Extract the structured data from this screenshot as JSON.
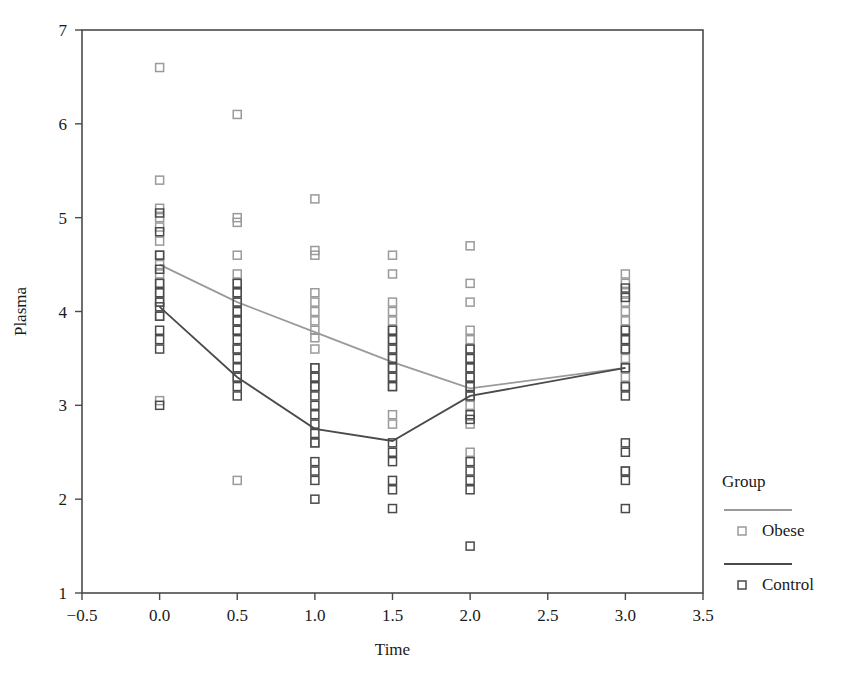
{
  "chart_data": {
    "type": "scatter",
    "title": "",
    "xlabel": "Time",
    "ylabel": "Plasma",
    "xlim": [
      -0.5,
      3.5
    ],
    "ylim": [
      1,
      7
    ],
    "xticks": [
      -0.5,
      0.0,
      0.5,
      1.0,
      1.5,
      2.0,
      2.5,
      3.0,
      3.5
    ],
    "xtick_labels": [
      "−0.5",
      "0.0",
      "0.5",
      "1.0",
      "1.5",
      "2.0",
      "2.5",
      "3.0",
      "3.5"
    ],
    "yticks": [
      1,
      2,
      3,
      4,
      5,
      6,
      7
    ],
    "ytick_labels": [
      "1",
      "2",
      "3",
      "4",
      "5",
      "6",
      "7"
    ],
    "grid": false,
    "legend": {
      "title": "Group",
      "position": "right",
      "entries": [
        {
          "name": "Obese",
          "color": "#9a9a9a",
          "marker": "open-square"
        },
        {
          "name": "Control",
          "color": "#4a4a4a",
          "marker": "open-square"
        }
      ]
    },
    "series": [
      {
        "name": "Obese",
        "color": "#9a9a9a",
        "marker": "open-square",
        "mean_line": {
          "x": [
            0.0,
            0.5,
            1.0,
            1.5,
            2.0,
            3.0
          ],
          "y": [
            4.5,
            4.1,
            3.78,
            3.46,
            3.18,
            3.4
          ]
        },
        "points": {
          "x": [
            0.0,
            0.0,
            0.0,
            0.0,
            0.0,
            0.0,
            0.0,
            0.0,
            0.0,
            0.0,
            0.0,
            0.0,
            0.0,
            0.0,
            0.5,
            0.5,
            0.5,
            0.5,
            0.5,
            0.5,
            0.5,
            0.5,
            0.5,
            0.5,
            0.5,
            0.5,
            0.5,
            0.5,
            1.0,
            1.0,
            1.0,
            1.0,
            1.0,
            1.0,
            1.0,
            1.0,
            1.0,
            1.0,
            1.0,
            1.0,
            1.0,
            1.0,
            1.5,
            1.5,
            1.5,
            1.5,
            1.5,
            1.5,
            1.5,
            1.5,
            1.5,
            1.5,
            1.5,
            1.5,
            1.5,
            1.5,
            2.0,
            2.0,
            2.0,
            2.0,
            2.0,
            2.0,
            2.0,
            2.0,
            2.0,
            2.0,
            2.0,
            2.0,
            2.0,
            2.0,
            3.0,
            3.0,
            3.0,
            3.0,
            3.0,
            3.0,
            3.0,
            3.0,
            3.0,
            3.0,
            3.0,
            3.0,
            3.0,
            3.0
          ],
          "y": [
            6.6,
            5.4,
            5.1,
            5.0,
            4.9,
            4.75,
            4.6,
            4.5,
            4.4,
            4.3,
            4.2,
            4.1,
            3.95,
            3.05,
            6.1,
            5.0,
            4.95,
            4.6,
            4.4,
            4.3,
            4.2,
            4.1,
            4.0,
            3.9,
            3.8,
            3.6,
            3.3,
            2.2,
            5.2,
            4.65,
            4.6,
            4.2,
            4.1,
            4.0,
            3.9,
            3.8,
            3.72,
            3.6,
            3.4,
            3.3,
            3.2,
            2.6,
            4.6,
            4.4,
            4.1,
            4.0,
            3.9,
            3.8,
            3.7,
            3.6,
            3.5,
            3.4,
            3.3,
            3.2,
            2.9,
            2.8,
            4.7,
            4.3,
            4.1,
            3.8,
            3.7,
            3.6,
            3.5,
            3.4,
            3.3,
            3.2,
            3.1,
            3.0,
            2.8,
            2.5,
            4.4,
            4.3,
            4.2,
            4.1,
            4.0,
            3.9,
            3.8,
            3.7,
            3.6,
            3.5,
            3.4,
            3.3,
            3.2,
            2.3
          ]
        }
      },
      {
        "name": "Control",
        "color": "#4a4a4a",
        "marker": "open-square",
        "mean_line": {
          "x": [
            0.0,
            0.5,
            1.0,
            1.5,
            2.0,
            3.0
          ],
          "y": [
            4.05,
            3.3,
            2.75,
            2.62,
            3.1,
            3.4
          ]
        },
        "points": {
          "x": [
            0.0,
            0.0,
            0.0,
            0.0,
            0.0,
            0.0,
            0.0,
            0.0,
            0.0,
            0.0,
            0.0,
            0.0,
            0.0,
            0.5,
            0.5,
            0.5,
            0.5,
            0.5,
            0.5,
            0.5,
            0.5,
            0.5,
            0.5,
            0.5,
            0.5,
            0.5,
            1.0,
            1.0,
            1.0,
            1.0,
            1.0,
            1.0,
            1.0,
            1.0,
            1.0,
            1.0,
            1.0,
            1.0,
            1.0,
            1.5,
            1.5,
            1.5,
            1.5,
            1.5,
            1.5,
            1.5,
            1.5,
            1.5,
            1.5,
            1.5,
            1.5,
            1.5,
            2.0,
            2.0,
            2.0,
            2.0,
            2.0,
            2.0,
            2.0,
            2.0,
            2.0,
            2.0,
            2.0,
            2.0,
            2.0,
            3.0,
            3.0,
            3.0,
            3.0,
            3.0,
            3.0,
            3.0,
            3.0,
            3.0,
            3.0,
            3.0,
            3.0,
            3.0
          ],
          "y": [
            5.05,
            4.85,
            4.6,
            4.45,
            4.3,
            4.2,
            4.1,
            4.05,
            3.95,
            3.8,
            3.7,
            3.6,
            3.0,
            4.3,
            4.2,
            4.1,
            4.0,
            3.9,
            3.8,
            3.7,
            3.6,
            3.5,
            3.4,
            3.3,
            3.2,
            3.1,
            3.4,
            3.3,
            3.2,
            3.1,
            3.0,
            2.9,
            2.8,
            2.7,
            2.6,
            2.4,
            2.3,
            2.2,
            2.0,
            3.8,
            3.7,
            3.6,
            3.5,
            3.4,
            3.3,
            3.2,
            2.6,
            2.5,
            2.4,
            2.2,
            2.1,
            1.9,
            3.6,
            3.5,
            3.4,
            3.3,
            3.2,
            3.1,
            2.9,
            2.85,
            2.4,
            2.3,
            2.2,
            2.1,
            1.5,
            4.25,
            4.15,
            3.8,
            3.7,
            3.6,
            3.4,
            3.2,
            3.1,
            2.6,
            2.5,
            2.3,
            2.2,
            1.9
          ]
        }
      }
    ]
  }
}
